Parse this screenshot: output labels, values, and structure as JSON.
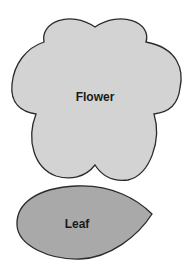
{
  "caption": {
    "text": "• • • g • g • •"
  },
  "shapes": [
    {
      "id": "flower",
      "label": "Flower",
      "fill": "#d3d3d3",
      "stroke": "#2b2b2b"
    },
    {
      "id": "leaf",
      "label": "Leaf",
      "fill": "#a9a9a9",
      "stroke": "#2b2b2b"
    }
  ]
}
